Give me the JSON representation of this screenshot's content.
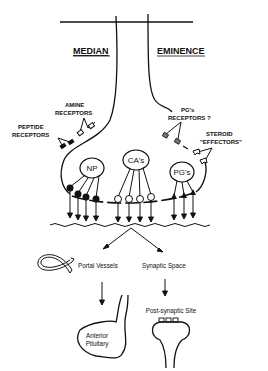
{
  "diagram": {
    "title_left": "MEDIAN",
    "title_right": "EMINENCE",
    "receptors": {
      "amine": [
        "AMINE",
        "RECEPTORS"
      ],
      "peptide": [
        "PEPTIDE",
        "RECEPTORS"
      ],
      "pgs": [
        "PG's",
        "RECEPTORS ?"
      ],
      "steroid": [
        "STEROID",
        "\"EFFECTORS\""
      ]
    },
    "nodes": {
      "np": "NP",
      "cas": "CA's",
      "pgs": "PG's"
    },
    "targets": {
      "portal_vessels": "Portal Vessels",
      "synaptic_space": "Synaptic Space",
      "anterior_pituitary_line1": "Anterior",
      "anterior_pituitary_line2": "Pituitary",
      "post_synaptic_site": "Post-synaptic Site"
    }
  }
}
